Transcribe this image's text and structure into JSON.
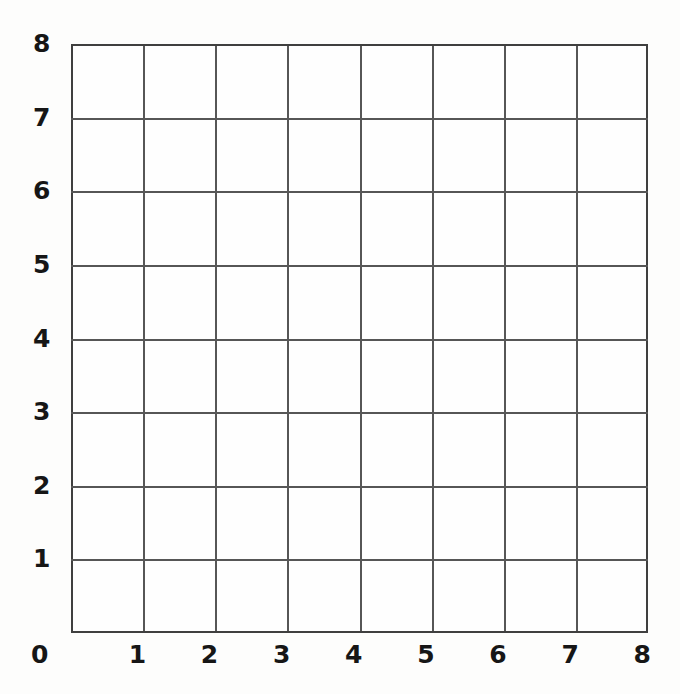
{
  "figure": {
    "kind": "blank-coordinate-grid",
    "background_color": "#fdfdfc",
    "grid_line_color": "#565656",
    "label_color": "#161616"
  },
  "chart_data": {
    "type": "scatter",
    "title": "",
    "subtitle": "",
    "xlabel": "",
    "ylabel": "",
    "xlim": [
      0,
      8
    ],
    "ylim": [
      0,
      8
    ],
    "x_tick_labels": [
      "0",
      "1",
      "2",
      "3",
      "4",
      "5",
      "6",
      "7",
      "8"
    ],
    "y_tick_labels": [
      "0",
      "1",
      "2",
      "3",
      "4",
      "5",
      "6",
      "7",
      "8"
    ],
    "x_ticks": [
      0,
      1,
      2,
      3,
      4,
      5,
      6,
      7,
      8
    ],
    "y_ticks": [
      0,
      1,
      2,
      3,
      4,
      5,
      6,
      7,
      8
    ],
    "grid": true,
    "grid_divisions_x": 8,
    "grid_divisions_y": 8,
    "legend": null,
    "legend_position": "none",
    "annotations": [],
    "series": [],
    "x": [],
    "values": []
  },
  "axes": {
    "origin_label": "0",
    "y_labels": [
      {
        "value": 8,
        "text": "8"
      },
      {
        "value": 7,
        "text": "7"
      },
      {
        "value": 6,
        "text": "6"
      },
      {
        "value": 5,
        "text": "5"
      },
      {
        "value": 4,
        "text": "4"
      },
      {
        "value": 3,
        "text": "3"
      },
      {
        "value": 2,
        "text": "2"
      },
      {
        "value": 1,
        "text": "1"
      }
    ],
    "x_labels": [
      {
        "value": 1,
        "text": "1"
      },
      {
        "value": 2,
        "text": "2"
      },
      {
        "value": 3,
        "text": "3"
      },
      {
        "value": 4,
        "text": "4"
      },
      {
        "value": 5,
        "text": "5"
      },
      {
        "value": 6,
        "text": "6"
      },
      {
        "value": 7,
        "text": "7"
      },
      {
        "value": 8,
        "text": "8"
      }
    ]
  }
}
